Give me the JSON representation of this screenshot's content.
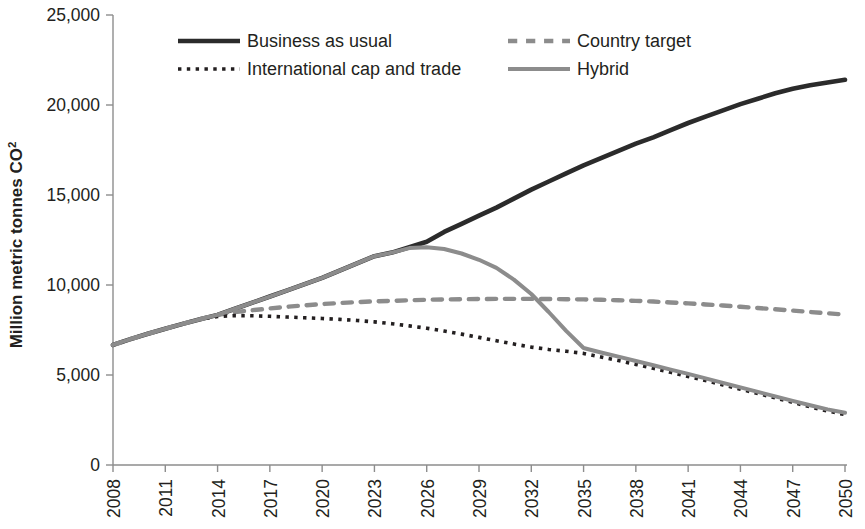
{
  "chart_data": {
    "type": "line",
    "title": "",
    "xlabel": "",
    "ylabel": "Million metric tonnes CO2",
    "ylabel_main": "Million metric tonnes CO",
    "ylabel_sub": "2",
    "xlim": [
      2008,
      2050
    ],
    "ylim": [
      0,
      25000
    ],
    "grid": false,
    "legend_position": "top-inside",
    "x_tick_labels": [
      "2008",
      "2011",
      "2014",
      "2017",
      "2020",
      "2023",
      "2026",
      "2029",
      "2032",
      "2035",
      "2038",
      "2041",
      "2044",
      "2047",
      "2050"
    ],
    "x_tick_values": [
      2008,
      2011,
      2014,
      2017,
      2020,
      2023,
      2026,
      2029,
      2032,
      2035,
      2038,
      2041,
      2044,
      2047,
      2050
    ],
    "y_tick_labels": [
      "0",
      "5,000",
      "10,000",
      "15,000",
      "20,000",
      "25,000"
    ],
    "y_tick_values": [
      0,
      5000,
      10000,
      15000,
      20000,
      25000
    ],
    "x": [
      2008,
      2009,
      2010,
      2011,
      2012,
      2013,
      2014,
      2015,
      2016,
      2017,
      2018,
      2019,
      2020,
      2021,
      2022,
      2023,
      2024,
      2025,
      2026,
      2027,
      2028,
      2029,
      2030,
      2031,
      2032,
      2033,
      2034,
      2035,
      2036,
      2037,
      2038,
      2039,
      2040,
      2041,
      2042,
      2043,
      2044,
      2045,
      2046,
      2047,
      2048,
      2049,
      2050
    ],
    "series": [
      {
        "name": "Business as usual",
        "color": "#2b2b2b",
        "style": "solid",
        "width": 4.6,
        "values": [
          6670,
          6990,
          7290,
          7570,
          7840,
          8100,
          8340,
          8680,
          9020,
          9360,
          9700,
          10050,
          10400,
          10800,
          11200,
          11600,
          11800,
          12100,
          12400,
          12950,
          13400,
          13850,
          14300,
          14800,
          15300,
          15750,
          16200,
          16650,
          17050,
          17450,
          17850,
          18200,
          18600,
          19000,
          19350,
          19700,
          20050,
          20350,
          20650,
          20900,
          21100,
          21250,
          21400
        ]
      },
      {
        "name": "Country target",
        "color": "#8c8c8c",
        "style": "dashed",
        "width": 4.4,
        "values": [
          6670,
          6990,
          7290,
          7570,
          7840,
          8100,
          8340,
          8500,
          8600,
          8700,
          8790,
          8870,
          8940,
          9000,
          9050,
          9090,
          9120,
          9150,
          9180,
          9200,
          9210,
          9220,
          9230,
          9230,
          9230,
          9220,
          9210,
          9200,
          9180,
          9150,
          9120,
          9080,
          9030,
          8980,
          8920,
          8860,
          8790,
          8720,
          8650,
          8580,
          8500,
          8430,
          8350
        ]
      },
      {
        "name": "International cap and trade",
        "color": "#231f20",
        "style": "dotted",
        "width": 3.6,
        "values": [
          6670,
          6990,
          7290,
          7570,
          7840,
          8100,
          8250,
          8300,
          8290,
          8260,
          8220,
          8180,
          8140,
          8090,
          8030,
          7950,
          7850,
          7730,
          7600,
          7440,
          7270,
          7090,
          6900,
          6720,
          6550,
          6420,
          6320,
          6200,
          6000,
          5800,
          5590,
          5370,
          5150,
          4920,
          4690,
          4450,
          4210,
          3970,
          3730,
          3480,
          3230,
          3000,
          2800
        ]
      },
      {
        "name": "Hybrid",
        "color": "#8c8c8c",
        "style": "solid",
        "width": 4.0,
        "values": [
          6670,
          6990,
          7290,
          7570,
          7840,
          8100,
          8340,
          8680,
          9020,
          9360,
          9700,
          10050,
          10400,
          10800,
          11200,
          11600,
          11800,
          12050,
          12100,
          12000,
          11750,
          11400,
          10950,
          10300,
          9500,
          8500,
          7450,
          6500,
          6250,
          6020,
          5780,
          5540,
          5300,
          5060,
          4810,
          4560,
          4310,
          4060,
          3810,
          3560,
          3320,
          3090,
          2900
        ]
      }
    ]
  },
  "legend": {
    "entries": [
      {
        "label": "Business as usual",
        "series": "Business as usual"
      },
      {
        "label": "Country target",
        "series": "Country target"
      },
      {
        "label": "International cap and trade",
        "series": "International cap and trade"
      },
      {
        "label": "Hybrid",
        "series": "Hybrid"
      }
    ]
  }
}
